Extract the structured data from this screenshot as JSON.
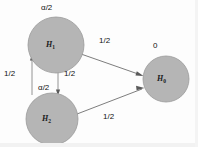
{
  "figure": {
    "kind": "state-transition-diagram",
    "width": 198,
    "height": 147,
    "background_color": "#fdfdfd",
    "node_fill_color": "#b5b5b5",
    "node_stroke_color": "#9a9a9a",
    "edge_color": "#6e6e6e",
    "text_color": "#1a1a1a"
  },
  "nodes": [
    {
      "id": "H1",
      "label_base": "H",
      "label_sub": "1",
      "annotation": "α/2",
      "cx": 56,
      "cy": 45,
      "r": 28
    },
    {
      "id": "H2",
      "label_base": "H",
      "label_sub": "2",
      "annotation": "α/2",
      "cx": 52,
      "cy": 119,
      "r": 26
    },
    {
      "id": "H0",
      "label_base": "H",
      "label_sub": "0",
      "annotation": "0",
      "cx": 166,
      "cy": 79,
      "r": 23
    }
  ],
  "edges": [
    {
      "id": "h1-to-h0",
      "from": "H1",
      "to": "H0",
      "label": "1/2"
    },
    {
      "id": "h2-to-h0",
      "from": "H2",
      "to": "H0",
      "label": "1/2"
    },
    {
      "id": "h2-to-h1",
      "from": "H2",
      "to": "H1",
      "label": "1/2"
    },
    {
      "id": "h1-to-h2",
      "from": "H1",
      "to": "H2",
      "label": "1/2"
    }
  ],
  "labels": {
    "annot_h1": "α/2",
    "annot_h2": "α/2",
    "annot_h0": "0",
    "edge_h1_h0": "1/2",
    "edge_h2_h0": "1/2",
    "edge_h2_h1": "1/2",
    "edge_h1_h2": "1/2"
  }
}
